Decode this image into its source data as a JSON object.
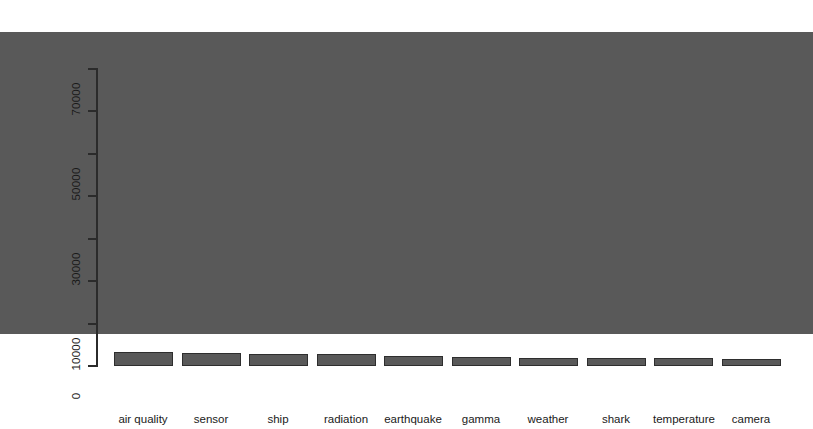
{
  "chart_data": {
    "type": "bar",
    "title": "",
    "subtitle": "",
    "xlabel": "",
    "ylabel": "",
    "categories": [
      "air quality",
      "sensor",
      "ship",
      "radiation",
      "earthquake",
      "gamma",
      "weather",
      "shark",
      "temperature",
      "camera"
    ],
    "values": [
      71000,
      4900,
      3300,
      3100,
      2800,
      2700,
      2200,
      2100,
      1800,
      1700
    ],
    "series": [
      {
        "name": "count",
        "values": [
          71000,
          4900,
          3300,
          3100,
          2800,
          2700,
          2200,
          2100,
          1800,
          1700
        ]
      }
    ],
    "ylim": [
      0,
      71000
    ],
    "y_ticks": [
      0,
      10000,
      20000,
      30000,
      40000,
      50000,
      60000,
      70000
    ],
    "y_tick_labels": [
      "0",
      "10000",
      "",
      "30000",
      "",
      "50000",
      "",
      "70000"
    ],
    "grid": false,
    "legend": null,
    "legend_position": "none",
    "orientation": "vertical",
    "bar_color": "#595959",
    "bar_border_color": "#2e2e2e",
    "axis_color": "#2b2b2b",
    "background": "#ffffff",
    "annotations": []
  },
  "axis": {
    "y_label_rotated": true,
    "tick_labels": [
      "0",
      "10000",
      "30000",
      "50000",
      "70000"
    ]
  }
}
